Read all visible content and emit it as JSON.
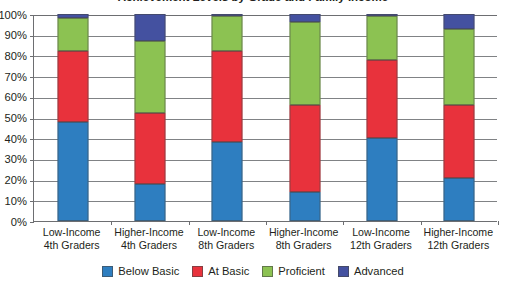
{
  "chart_data": {
    "type": "bar",
    "subtype": "stacked-bar-100",
    "title": "Achievement Levels by Grade and Family Income",
    "xlabel": "",
    "ylabel": "",
    "ylim": [
      0,
      100
    ],
    "ytick_labels": [
      "100%",
      "90%",
      "80%",
      "70%",
      "60%",
      "50%",
      "40%",
      "30%",
      "20%",
      "10%",
      "0%"
    ],
    "ytick_values": [
      100,
      90,
      80,
      70,
      60,
      50,
      40,
      30,
      20,
      10,
      0
    ],
    "grid": true,
    "legend_position": "bottom",
    "categories": [
      "Low-Income 4th Graders",
      "Higher-Income 4th Graders",
      "Low-Income 8th Graders",
      "Higher-Income 8th Graders",
      "Low-Income 12th Graders",
      "Higher-Income 12th Graders"
    ],
    "category_lines": [
      [
        "Low-Income",
        "4th Graders"
      ],
      [
        "Higher-Income",
        "4th Graders"
      ],
      [
        "Low-Income",
        "8th Graders"
      ],
      [
        "Higher-Income",
        "8th Graders"
      ],
      [
        "Low-Income",
        "12th Graders"
      ],
      [
        "Higher-Income",
        "12th Graders"
      ]
    ],
    "series": [
      {
        "name": "Below Basic",
        "color": "#2E7EC0",
        "values": [
          48,
          18,
          38,
          14,
          40,
          21
        ]
      },
      {
        "name": "At Basic",
        "color": "#E8323C",
        "values": [
          34,
          34,
          44,
          42,
          38,
          35
        ]
      },
      {
        "name": "Proficient",
        "color": "#8CC252",
        "values": [
          16,
          35,
          17,
          40,
          21,
          37
        ]
      },
      {
        "name": "Advanced",
        "color": "#4451A0",
        "values": [
          2,
          13,
          1,
          4,
          1,
          7
        ]
      }
    ]
  },
  "legend": {
    "items": [
      {
        "label": "Below Basic",
        "color": "#2E7EC0"
      },
      {
        "label": "At Basic",
        "color": "#E8323C"
      },
      {
        "label": "Proficient",
        "color": "#8CC252"
      },
      {
        "label": "Advanced",
        "color": "#4451A0"
      }
    ]
  }
}
